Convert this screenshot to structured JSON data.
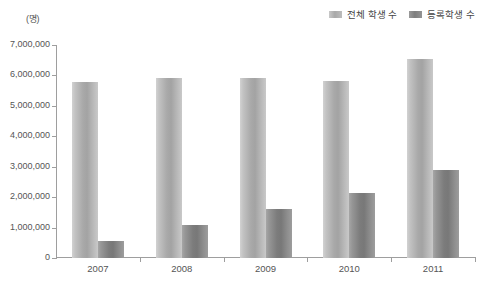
{
  "chart_data": {
    "type": "bar",
    "title": "",
    "unit_label": "(명)",
    "xlabel": "",
    "ylabel": "",
    "categories": [
      "2007",
      "2008",
      "2009",
      "2010",
      "2011"
    ],
    "series": [
      {
        "name": "전체 학생 수",
        "color": "#b0b0b0",
        "values": [
          5780000,
          5930000,
          5910000,
          5810000,
          6550000
        ]
      },
      {
        "name": "등록학생 수",
        "color": "#858585",
        "values": [
          550000,
          1080000,
          1600000,
          2150000,
          2900000
        ]
      }
    ],
    "ylim": [
      0,
      7000000
    ],
    "ytick_values": [
      0,
      1000000,
      2000000,
      3000000,
      4000000,
      5000000,
      6000000,
      7000000
    ],
    "ytick_labels": [
      "0",
      "1,000,000",
      "2,000,000",
      "3,000,000",
      "4,000,000",
      "5,000,000",
      "6,000,000",
      "7,000,000"
    ],
    "grid": false,
    "legend_position": "top-right"
  },
  "legend": {
    "items": [
      {
        "label": "전체 학생 수",
        "swatch": "total"
      },
      {
        "label": "등록학생 수",
        "swatch": "registered"
      }
    ]
  }
}
